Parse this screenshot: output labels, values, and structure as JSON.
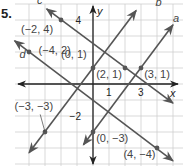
{
  "problem_number": "5.",
  "axes": {
    "x_label": "x",
    "y_label": "y",
    "xlim": [
      -5.5,
      5.5
    ],
    "ylim": [
      -5,
      5
    ],
    "ticks": [
      {
        "axis": "x",
        "value": 1,
        "label": "1"
      },
      {
        "axis": "x",
        "value": 3,
        "label": "3"
      },
      {
        "axis": "y",
        "value": 4,
        "label": "4"
      },
      {
        "axis": "y",
        "value": -2,
        "label": "−2"
      }
    ]
  },
  "colors": {
    "line": "#555555",
    "grid": "#cfcfcf",
    "axis": "#222222",
    "label": "#444444"
  },
  "lines": [
    {
      "name": "a",
      "p1": [
        0,
        -3
      ],
      "p2": [
        3,
        1
      ]
    },
    {
      "name": "b",
      "p1": [
        -3,
        -3
      ],
      "p2": [
        0,
        1
      ]
    },
    {
      "name": "c",
      "p1": [
        -2,
        4
      ],
      "p2": [
        2,
        1
      ]
    },
    {
      "name": "d",
      "p1": [
        -4,
        2
      ],
      "p2": [
        4,
        -4
      ]
    }
  ],
  "points": [
    {
      "label": "(−2, 4)",
      "x": -2,
      "y": 4
    },
    {
      "label": "(−4, 2)",
      "x": -4,
      "y": 2
    },
    {
      "label": "(0, 1)",
      "x": 0,
      "y": 1
    },
    {
      "label": "(2, 1)",
      "x": 2,
      "y": 1
    },
    {
      "label": "(3, 1)",
      "x": 3,
      "y": 1
    },
    {
      "label": "(−3, −3)",
      "x": -3,
      "y": -3
    },
    {
      "label": "(0, −3)",
      "x": 0,
      "y": -3
    },
    {
      "label": "(4, −4)",
      "x": 4,
      "y": -4
    }
  ]
}
